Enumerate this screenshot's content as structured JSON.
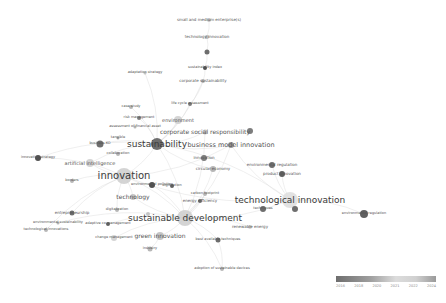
{
  "visualization": {
    "type": "co-occurrence keyword network (overlay)",
    "legend": {
      "ticks": [
        "2016",
        "2018",
        "2020",
        "2021",
        "2022",
        "2024"
      ],
      "color_low": "#6e6e6e",
      "color_mid": "#dcdcdc",
      "color_high": "#9a9a9a"
    },
    "nodes": [
      {
        "id": "sme",
        "label": "small and medium enterprise(s)",
        "x": 209,
        "y": 20,
        "r": 2,
        "fs": 4,
        "c": "#bdbdbd"
      },
      {
        "id": "tech_innov_top",
        "label": "technology innovation",
        "x": 207,
        "y": 37,
        "r": 2,
        "fs": 4,
        "c": "#b0b0b0"
      },
      {
        "id": "n_small1",
        "label": "",
        "x": 207,
        "y": 52,
        "r": 2.5,
        "fs": 0,
        "c": "#555"
      },
      {
        "id": "sust_index",
        "label": "sustainability index",
        "x": 205,
        "y": 68,
        "r": 2,
        "fs": 3.5,
        "c": "#333"
      },
      {
        "id": "adaptation",
        "label": "adaptation strategy",
        "x": 145,
        "y": 73,
        "r": 1.5,
        "fs": 3.5,
        "c": "#bbb"
      },
      {
        "id": "corp_sust",
        "label": "corporate sustainability",
        "x": 203,
        "y": 81,
        "r": 2,
        "fs": 4,
        "c": "#aaa"
      },
      {
        "id": "case_study",
        "label": "case study",
        "x": 131,
        "y": 107,
        "r": 2,
        "fs": 3.5,
        "c": "#aaa"
      },
      {
        "id": "life_cycle",
        "label": "life cycle assessment",
        "x": 190,
        "y": 104,
        "r": 2,
        "fs": 3.5,
        "c": "#666"
      },
      {
        "id": "risk_mgmt",
        "label": "risk management",
        "x": 139,
        "y": 118,
        "r": 2,
        "fs": 3.5,
        "c": "#666"
      },
      {
        "id": "environment",
        "label": "environment",
        "x": 178,
        "y": 120,
        "r": 4,
        "fs": 5,
        "c": "#ccc"
      },
      {
        "id": "assessment",
        "label": "assessment of financial asset",
        "x": 135,
        "y": 127,
        "r": 1.5,
        "fs": 3.5,
        "c": "#aaa"
      },
      {
        "id": "csr",
        "label": "corporate social responsibility",
        "x": 205,
        "y": 132,
        "r": 2.5,
        "fs": 6,
        "c": "#bbb"
      },
      {
        "id": "csr_node",
        "label": "",
        "x": 250,
        "y": 131,
        "r": 3,
        "fs": 0,
        "c": "#666"
      },
      {
        "id": "sust",
        "label": "sustainability",
        "x": 157,
        "y": 144,
        "r": 6,
        "fs": 9,
        "c": "#555"
      },
      {
        "id": "bmi",
        "label": "business model innovation",
        "x": 231,
        "y": 145,
        "r": 3,
        "fs": 6.5,
        "c": "#888"
      },
      {
        "id": "tangible",
        "label": "tangible",
        "x": 118,
        "y": 138,
        "r": 1.5,
        "fs": 3.5,
        "c": "#aaa"
      },
      {
        "id": "n_leftcluster",
        "label": "business KO",
        "x": 100,
        "y": 144,
        "r": 3.5,
        "fs": 3.5,
        "c": "#555"
      },
      {
        "id": "innov_strategy",
        "label": "innovation strategy",
        "x": 38,
        "y": 158,
        "r": 3,
        "fs": 3.5,
        "c": "#333"
      },
      {
        "id": "collaboration",
        "label": "collaboration",
        "x": 118,
        "y": 154,
        "r": 2,
        "fs": 3.5,
        "c": "#aaa"
      },
      {
        "id": "ai",
        "label": "artificial intelligence",
        "x": 90,
        "y": 163,
        "r": 4,
        "fs": 5,
        "c": "#ccc"
      },
      {
        "id": "innovation",
        "label": "innovation",
        "x": 124,
        "y": 176,
        "r": 8,
        "fs": 10,
        "c": "#ccc"
      },
      {
        "id": "innov_node",
        "label": "innovation",
        "x": 204,
        "y": 158,
        "r": 3,
        "fs": 4,
        "c": "#666"
      },
      {
        "id": "circular",
        "label": "circular economy",
        "x": 213,
        "y": 169,
        "r": 3,
        "fs": 4,
        "c": "#aaa"
      },
      {
        "id": "env_regulation",
        "label": "environmental regulation",
        "x": 272,
        "y": 165,
        "r": 3,
        "fs": 4,
        "c": "#555"
      },
      {
        "id": "product_innov",
        "label": "product innovation",
        "x": 282,
        "y": 174,
        "r": 3,
        "fs": 4,
        "c": "#444"
      },
      {
        "id": "borders",
        "label": "borders",
        "x": 72,
        "y": 181,
        "r": 2,
        "fs": 3.5,
        "c": "#aaa"
      },
      {
        "id": "env_pollution",
        "label": "environmental pollution",
        "x": 152,
        "y": 185,
        "r": 3,
        "fs": 3.5,
        "c": "#333"
      },
      {
        "id": "digitization",
        "label": "digitization",
        "x": 172,
        "y": 186,
        "r": 2,
        "fs": 3.5,
        "c": "#444"
      },
      {
        "id": "technology",
        "label": "technology",
        "x": 133,
        "y": 197,
        "r": 3,
        "fs": 6,
        "c": "#bbb"
      },
      {
        "id": "carbon",
        "label": "carbon footprint",
        "x": 205,
        "y": 194,
        "r": 2,
        "fs": 3.5,
        "c": "#aaa"
      },
      {
        "id": "energy_eff",
        "label": "energy efficiency",
        "x": 200,
        "y": 201,
        "r": 2,
        "fs": 4,
        "c": "#555"
      },
      {
        "id": "tech_innovation",
        "label": "technological innovation",
        "x": 290,
        "y": 200,
        "r": 8,
        "fs": 9,
        "c": "#ddd"
      },
      {
        "id": "tech_small",
        "label": "techniques",
        "x": 263,
        "y": 209,
        "r": 3,
        "fs": 3.5,
        "c": "#555"
      },
      {
        "id": "tech_right_node",
        "label": "",
        "x": 295,
        "y": 209,
        "r": 3,
        "fs": 0,
        "c": "#555"
      },
      {
        "id": "env_regulation2",
        "label": "environmental regulation",
        "x": 364,
        "y": 214,
        "r": 4,
        "fs": 3.5,
        "c": "#444"
      },
      {
        "id": "digitalization",
        "label": "digitalization",
        "x": 117,
        "y": 210,
        "r": 2,
        "fs": 3.5,
        "c": "#aaa"
      },
      {
        "id": "entrepreneurship",
        "label": "entrepreneurship",
        "x": 72,
        "y": 213,
        "r": 2.5,
        "fs": 4,
        "c": "#555"
      },
      {
        "id": "env_sust",
        "label": "environmental sustainability",
        "x": 58,
        "y": 223,
        "r": 1.5,
        "fs": 3.5,
        "c": "#aaa"
      },
      {
        "id": "tech_innovations",
        "label": "technological innovations",
        "x": 46,
        "y": 230,
        "r": 2,
        "fs": 3.5,
        "c": "#aaa"
      },
      {
        "id": "sust_dev",
        "label": "sustainable development",
        "x": 185,
        "y": 218,
        "r": 8,
        "fs": 9,
        "c": "#ccc"
      },
      {
        "id": "climate",
        "label": "",
        "x": 148,
        "y": 214,
        "r": 2,
        "fs": 0,
        "c": "#bbb"
      },
      {
        "id": "adaptive",
        "label": "adaptive co-management",
        "x": 108,
        "y": 224,
        "r": 2,
        "fs": 3.5,
        "c": "#444"
      },
      {
        "id": "renewable",
        "label": "renewable energy",
        "x": 250,
        "y": 227,
        "r": 2,
        "fs": 4,
        "c": "#ccc"
      },
      {
        "id": "change_mgmt",
        "label": "change management",
        "x": 114,
        "y": 238,
        "r": 3,
        "fs": 3.5,
        "c": "#ccc"
      },
      {
        "id": "green_innov",
        "label": "green innovation",
        "x": 160,
        "y": 236,
        "r": 4,
        "fs": 6,
        "c": "#bbb"
      },
      {
        "id": "best_avail",
        "label": "best available techniques",
        "x": 218,
        "y": 240,
        "r": 2.5,
        "fs": 3.5,
        "c": "#555"
      },
      {
        "id": "industry",
        "label": "industry",
        "x": 150,
        "y": 249,
        "r": 2.5,
        "fs": 3.5,
        "c": "#aaa"
      },
      {
        "id": "adoption",
        "label": "adoption of sustainable devices",
        "x": 222,
        "y": 269,
        "r": 2,
        "fs": 3.5,
        "c": "#aaa"
      }
    ],
    "edges": [
      [
        "sme",
        "tech_innov_top"
      ],
      [
        "tech_innov_top",
        "n_small1"
      ],
      [
        "n_small1",
        "sust_index"
      ],
      [
        "sust_index",
        "corp_sust"
      ],
      [
        "corp_sust",
        "sust"
      ],
      [
        "corp_sust",
        "life_cycle"
      ],
      [
        "life_cycle",
        "sust"
      ],
      [
        "case_study",
        "sust"
      ],
      [
        "risk_mgmt",
        "sust"
      ],
      [
        "environment",
        "sust"
      ],
      [
        "csr",
        "sust"
      ],
      [
        "csr",
        "sust_dev"
      ],
      [
        "bmi",
        "sust"
      ],
      [
        "bmi",
        "innovation"
      ],
      [
        "bmi",
        "sust_dev"
      ],
      [
        "sust",
        "innovation"
      ],
      [
        "sust",
        "sust_dev"
      ],
      [
        "sust",
        "tech_innovation"
      ],
      [
        "innovation",
        "sust_dev"
      ],
      [
        "innovation",
        "technology"
      ],
      [
        "innovation",
        "ai"
      ],
      [
        "ai",
        "sust"
      ],
      [
        "innov_strategy",
        "innovation"
      ],
      [
        "innov_strategy",
        "sust"
      ],
      [
        "n_leftcluster",
        "sust"
      ],
      [
        "tech_innovation",
        "sust_dev"
      ],
      [
        "tech_innovation",
        "env_regulation"
      ],
      [
        "tech_innovation",
        "product_innov"
      ],
      [
        "tech_innovation",
        "env_regulation2"
      ],
      [
        "tech_innovation",
        "innovation"
      ],
      [
        "sust_dev",
        "green_innov"
      ],
      [
        "sust_dev",
        "renewable"
      ],
      [
        "sust_dev",
        "energy_eff"
      ],
      [
        "sust_dev",
        "technology"
      ],
      [
        "sust_dev",
        "best_avail"
      ],
      [
        "sust_dev",
        "adoption"
      ],
      [
        "green_innov",
        "industry"
      ],
      [
        "entrepreneurship",
        "innovation"
      ],
      [
        "env_sust",
        "sust_dev"
      ],
      [
        "tech_innovations",
        "innovation"
      ],
      [
        "circular",
        "sust_dev"
      ],
      [
        "circular",
        "sust"
      ],
      [
        "carbon",
        "sust_dev"
      ],
      [
        "adaptive",
        "sust_dev"
      ],
      [
        "change_mgmt",
        "sust_dev"
      ],
      [
        "digitalization",
        "innovation"
      ],
      [
        "borders",
        "innovation"
      ],
      [
        "env_pollution",
        "sust_dev"
      ],
      [
        "adaptation",
        "sust"
      ],
      [
        "tech_innovation",
        "bmi"
      ],
      [
        "best_avail",
        "adoption"
      ]
    ]
  }
}
